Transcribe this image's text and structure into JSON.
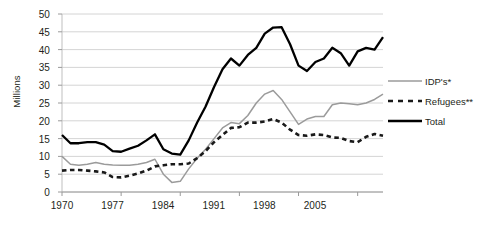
{
  "chart_data": {
    "type": "line",
    "title": "",
    "xlabel": "",
    "ylabel": "Millions",
    "xlim": [
      1970,
      2008
    ],
    "ylim": [
      0,
      50
    ],
    "ytick_step": 5,
    "yticks": [
      "50",
      "45",
      "40",
      "35",
      "30",
      "25",
      "20",
      "15",
      "10",
      "5",
      "0"
    ],
    "xticks": [
      "1970",
      "1977",
      "1984",
      "1991",
      "1998",
      "2005"
    ],
    "grid": true,
    "legend_position": "right",
    "x": [
      1970,
      1971,
      1972,
      1973,
      1974,
      1975,
      1976,
      1977,
      1978,
      1979,
      1980,
      1981,
      1982,
      1983,
      1984,
      1985,
      1986,
      1987,
      1988,
      1989,
      1990,
      1991,
      1992,
      1993,
      1994,
      1995,
      1996,
      1997,
      1998,
      1999,
      2000,
      2001,
      2002,
      2003,
      2004,
      2005,
      2006,
      2007,
      2008
    ],
    "series": [
      {
        "name": "IDP's*",
        "color": "#9b9b9b",
        "style": "solid",
        "values": [
          10.0,
          7.8,
          7.5,
          7.8,
          8.3,
          7.8,
          7.6,
          7.5,
          7.5,
          7.8,
          8.3,
          9.2,
          5.0,
          2.7,
          3.0,
          6.5,
          9.5,
          12.0,
          15.0,
          18.0,
          19.5,
          19.2,
          21.5,
          25.0,
          27.5,
          28.5,
          26.0,
          22.5,
          19.0,
          20.5,
          21.2,
          21.2,
          24.5,
          25.0,
          24.8,
          24.5,
          25.0,
          26.0,
          27.5
        ]
      },
      {
        "name": "Refugees**",
        "color": "#1a1a1a",
        "style": "dashed",
        "values": [
          6.0,
          6.2,
          6.2,
          6.0,
          5.8,
          5.5,
          4.2,
          4.1,
          4.6,
          5.2,
          6.0,
          7.2,
          7.5,
          7.8,
          7.8,
          8.0,
          9.5,
          11.5,
          14.0,
          16.0,
          18.0,
          18.2,
          19.5,
          19.5,
          19.8,
          20.5,
          19.5,
          17.5,
          16.0,
          15.8,
          16.2,
          16.0,
          15.3,
          15.2,
          14.3,
          14.0,
          15.5,
          16.3,
          15.8
        ]
      },
      {
        "name": "Total",
        "color": "#000000",
        "style": "solid-thick",
        "values": [
          16.0,
          13.7,
          13.7,
          14.0,
          14.0,
          13.3,
          11.5,
          11.3,
          12.2,
          13.0,
          14.5,
          16.2,
          12.0,
          10.8,
          10.5,
          14.5,
          19.5,
          24.0,
          29.5,
          34.5,
          37.5,
          35.5,
          38.5,
          40.5,
          44.5,
          46.2,
          46.3,
          41.5,
          35.5,
          34.0,
          36.5,
          37.5,
          40.5,
          39.0,
          35.5,
          39.5,
          40.5,
          40.0,
          43.5
        ]
      }
    ],
    "legend": [
      {
        "label": "IDP's*",
        "marker": "line-gray"
      },
      {
        "label": "Refugees**",
        "marker": "line-dashed-black"
      },
      {
        "label": "Total",
        "marker": "line-thick-black"
      }
    ]
  }
}
